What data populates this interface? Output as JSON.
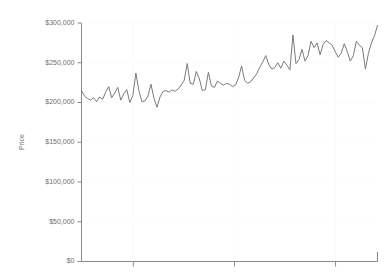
{
  "chart_data": {
    "type": "line",
    "title": "",
    "subtitle": "",
    "xlabel": "",
    "ylabel": "Price",
    "ylim": [
      0,
      300000
    ],
    "xlim": [
      0,
      120
    ],
    "grid": true,
    "legend": null,
    "legend_position": "none",
    "y_ticks": [
      0,
      50000,
      100000,
      150000,
      200000,
      250000,
      300000
    ],
    "y_tick_labels": [
      "$0",
      "$50,000",
      "$100,000",
      "$150,000",
      "$200,000",
      "$250,000",
      "$300,000"
    ],
    "x_ticks": [
      21,
      62,
      103
    ],
    "x_tick_labels": [
      "",
      "",
      ""
    ],
    "line_color": "#7a7a7a",
    "line_width": 1,
    "background_color": "#ffffff",
    "axis_color": "#8a8a8a",
    "grid_color": "#fbfbfb",
    "series": [
      {
        "name": "Price",
        "values": [
          215000,
          208000,
          205000,
          203000,
          206000,
          201000,
          207000,
          204000,
          213000,
          220000,
          206000,
          212000,
          219000,
          203000,
          211000,
          216000,
          200000,
          209000,
          237000,
          215000,
          201000,
          202000,
          208000,
          223000,
          205000,
          194000,
          207000,
          214000,
          215000,
          213000,
          216000,
          214000,
          217000,
          222000,
          228000,
          249000,
          224000,
          223000,
          239000,
          230000,
          215000,
          216000,
          238000,
          221000,
          219000,
          227000,
          224000,
          222000,
          224000,
          223000,
          220000,
          222000,
          231000,
          246000,
          228000,
          224000,
          226000,
          231000,
          236000,
          244000,
          251000,
          259000,
          248000,
          242000,
          244000,
          250000,
          243000,
          252000,
          247000,
          241000,
          285000,
          249000,
          254000,
          267000,
          252000,
          259000,
          277000,
          269000,
          275000,
          260000,
          273000,
          278000,
          275000,
          272000,
          264000,
          257000,
          262000,
          274000,
          264000,
          252000,
          259000,
          277000,
          272000,
          269000,
          242000,
          262000,
          275000,
          284000,
          297000
        ]
      }
    ]
  },
  "axis": {
    "y_title": "Price"
  }
}
